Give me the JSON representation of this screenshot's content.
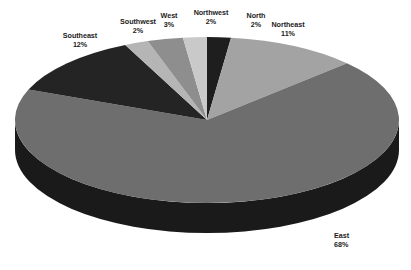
{
  "chart_data": {
    "type": "pie",
    "title": "",
    "subtitle": "",
    "xlabel": "",
    "ylabel": "",
    "legend_position": "none",
    "grid": false,
    "three_d": true,
    "start_angle_deg": 0,
    "direction": "clockwise",
    "categories": [
      "North",
      "Northeast",
      "East",
      "Southeast",
      "Southwest",
      "West",
      "Northwest"
    ],
    "values": [
      2,
      11,
      68,
      12,
      2,
      3,
      2
    ],
    "value_unit": "%",
    "slices": [
      {
        "label": "North",
        "percent": 2,
        "pct_text": "2%",
        "color": "#1e1e1e",
        "side_color": "#0d0d0d"
      },
      {
        "label": "Northeast",
        "percent": 11,
        "pct_text": "11%",
        "color": "#a3a3a3",
        "side_color": "#6b6b6b"
      },
      {
        "label": "East",
        "percent": 68,
        "pct_text": "68%",
        "color": "#6e6e6e",
        "side_color": "#1a1a1a"
      },
      {
        "label": "Southeast",
        "percent": 12,
        "pct_text": "12%",
        "color": "#242424",
        "side_color": "#111111"
      },
      {
        "label": "Southwest",
        "percent": 2,
        "pct_text": "2%",
        "color": "#b5b5b5",
        "side_color": "#777777"
      },
      {
        "label": "West",
        "percent": 3,
        "pct_text": "3%",
        "color": "#8e8e8e",
        "side_color": "#5a5a5a"
      },
      {
        "label": "Northwest",
        "percent": 2,
        "pct_text": "2%",
        "color": "#c9c9c9",
        "side_color": "#858585"
      }
    ],
    "background_color": "#ffffff",
    "label_color": "#1c1c1c"
  },
  "labels": {
    "southeast": {
      "name": "Southeast",
      "pct": "12%"
    },
    "southwest": {
      "name": "Southwest",
      "pct": "2%"
    },
    "west": {
      "name": "West",
      "pct": "3%"
    },
    "northwest": {
      "name": "Northwest",
      "pct": "2%"
    },
    "north": {
      "name": "North",
      "pct": "2%"
    },
    "northeast": {
      "name": "Northeast",
      "pct": "11%"
    },
    "east": {
      "name": "East",
      "pct": "68%"
    }
  }
}
